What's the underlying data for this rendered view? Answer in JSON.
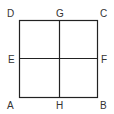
{
  "diagram": {
    "type": "square-divided-into-four",
    "stroke_color": "#222222",
    "label_color": "#333333",
    "labels": {
      "A": "A",
      "B": "B",
      "C": "C",
      "D": "D",
      "E": "E",
      "F": "F",
      "G": "G",
      "H": "H"
    }
  }
}
